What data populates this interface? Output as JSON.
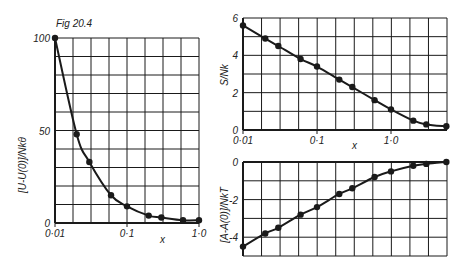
{
  "figure": {
    "caption": "Fig 20.4",
    "ink_color": "#1a1a1a",
    "background": "#ffffff"
  },
  "chart_data": [
    {
      "type": "line",
      "id": "energy",
      "title": "",
      "xlabel": "x",
      "ylabel": "[U-U(0)]/Nkθ",
      "xscale": "log",
      "xlim": [
        0.01,
        1.0
      ],
      "ylim": [
        0,
        100
      ],
      "grid": true,
      "x_tick_labels": [
        "0·01",
        "0·1",
        "1·0"
      ],
      "x_ticks": [
        0.01,
        0.1,
        1.0
      ],
      "y_tick_labels": [
        "0",
        "50",
        "100"
      ],
      "y_ticks": [
        0,
        50,
        100
      ],
      "markers": true,
      "x": [
        0.01,
        0.02,
        0.03,
        0.06,
        0.1,
        0.2,
        0.3,
        0.6,
        1.0
      ],
      "y": [
        100,
        48,
        33,
        15,
        9,
        4,
        3,
        1.5,
        1.5
      ]
    },
    {
      "type": "line",
      "id": "entropy",
      "title": "",
      "xlabel": "x",
      "ylabel": "S/Nk",
      "xscale": "log",
      "xlim": [
        0.01,
        5.6
      ],
      "ylim": [
        0,
        6
      ],
      "grid": true,
      "x_tick_labels": [
        "0·01",
        "0·1",
        "1·0"
      ],
      "x_ticks": [
        0.01,
        0.1,
        1.0
      ],
      "y_tick_labels": [
        "0",
        "2",
        "4",
        "6"
      ],
      "y_ticks": [
        0,
        2,
        4,
        6
      ],
      "markers": true,
      "x": [
        0.01,
        0.02,
        0.03,
        0.06,
        0.1,
        0.2,
        0.3,
        0.6,
        1.0,
        2.0,
        3.0,
        5.6
      ],
      "y": [
        5.6,
        4.9,
        4.5,
        3.8,
        3.4,
        2.7,
        2.3,
        1.6,
        1.1,
        0.5,
        0.3,
        0.2
      ]
    },
    {
      "type": "line",
      "id": "free-energy",
      "title": "",
      "xlabel": "",
      "ylabel": "[A-A(0)]/NkT",
      "xscale": "log",
      "xlim": [
        0.01,
        5.6
      ],
      "ylim": [
        -5,
        0
      ],
      "grid": true,
      "x_tick_labels": [],
      "x_ticks": [
        0.01,
        0.1,
        1.0
      ],
      "y_tick_labels": [
        "0",
        "-2",
        "-4"
      ],
      "y_ticks": [
        0,
        -2,
        -4
      ],
      "markers": true,
      "x": [
        0.01,
        0.02,
        0.03,
        0.06,
        0.1,
        0.2,
        0.3,
        0.6,
        1.0,
        2.0,
        3.0,
        5.6
      ],
      "y": [
        -4.5,
        -3.8,
        -3.5,
        -2.8,
        -2.4,
        -1.7,
        -1.4,
        -0.8,
        -0.5,
        -0.2,
        -0.1,
        0.0
      ]
    }
  ],
  "layout": {
    "panels": {
      "energy": {
        "x0": 55,
        "x1": 199,
        "y0": 38,
        "y1": 223,
        "decade_px": 72,
        "ncols": 8,
        "nrows": 10
      },
      "entropy": {
        "x0": 243,
        "x1": 447,
        "y0": 18,
        "y1": 130,
        "decade_px": 74,
        "ncols": 11,
        "nrows": 6
      },
      "free-energy": {
        "x0": 243,
        "x1": 447,
        "y0": 162,
        "y1": 256,
        "decade_px": 74,
        "ncols": 11,
        "nrows": 5
      }
    },
    "labels": {
      "caption": {
        "x": 56,
        "y": 27
      },
      "energy_xlabel": {
        "x": 160,
        "y": 243
      },
      "entropy_xlabel": {
        "x": 352,
        "y": 149
      },
      "energy_ylabel": {
        "x": 26,
        "y": 165
      },
      "entropy_ylabel": {
        "x": 228,
        "y": 75
      },
      "free_energy_ylabel": {
        "x": 228,
        "y": 215
      }
    }
  }
}
